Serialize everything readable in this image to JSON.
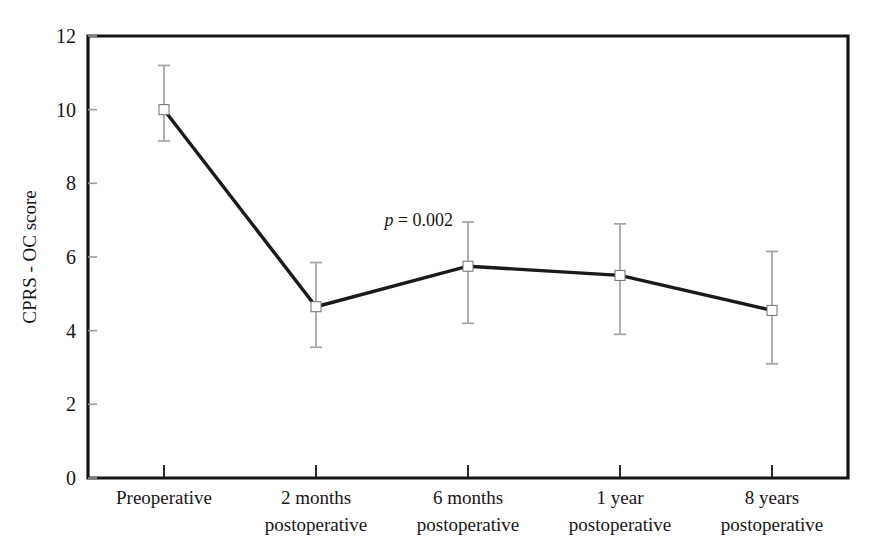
{
  "chart_data": {
    "type": "line",
    "title": "",
    "xlabel": "",
    "ylabel": "CPRS - OC score",
    "ylim": [
      0,
      12
    ],
    "yticks": [
      0,
      2,
      4,
      6,
      8,
      10,
      12
    ],
    "ytick_labels": [
      "0",
      "2",
      "4",
      "6",
      "8",
      "10",
      "12"
    ],
    "grid": false,
    "legend": "none",
    "categories": [
      "Preoperative",
      "2 months postoperative",
      "6 months postoperative",
      "1 year postoperative",
      "8 years postoperative"
    ],
    "category_lines": [
      [
        "Preoperative",
        ""
      ],
      [
        "2 months",
        "postoperative"
      ],
      [
        "6 months",
        "postoperative"
      ],
      [
        "1 year",
        "postoperative"
      ],
      [
        "8 years",
        "postoperative"
      ]
    ],
    "series": [
      {
        "name": "CPRS - OC score",
        "values": [
          10.0,
          4.65,
          5.75,
          5.5,
          4.55
        ],
        "error_low": [
          9.15,
          3.55,
          4.2,
          3.9,
          3.1
        ],
        "error_high": [
          11.2,
          5.85,
          6.95,
          6.9,
          6.15
        ],
        "marker": "square",
        "marker_color": "#ffffff",
        "line_color": "#1a1a1a"
      }
    ],
    "annotations": [
      {
        "name": "p-value",
        "italic_part": "p",
        "rest": " = 0.002",
        "full_text": "p = 0.002",
        "x_value": 1.45,
        "y_value": 6.85
      }
    ],
    "colors": {
      "axis": "#151515",
      "line": "#1a1a1a",
      "error_bar": "#a8a8a8",
      "marker_fill": "#ffffff",
      "background": "#ffffff",
      "text": "#161616"
    }
  }
}
